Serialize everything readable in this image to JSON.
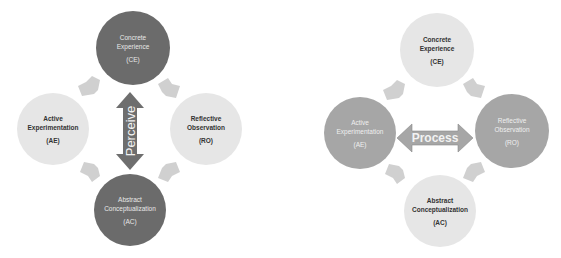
{
  "colors": {
    "dark_circle": "#6b6b6b",
    "light_circle": "#e6e6e6",
    "medium_circle": "#a6a6a6",
    "cycle_arrow": "#d0d0d0",
    "perceive_arrow": "#6e6e6e",
    "process_arrow": "#a6a6a6"
  },
  "diagrams": [
    {
      "name": "perceive-diagram",
      "center_arrow": {
        "label": "Perceive",
        "orientation": "vertical"
      },
      "nodes": {
        "top": {
          "lines": [
            "Concrete",
            "Experience"
          ],
          "abbr": "(CE)",
          "style": "dark"
        },
        "left": {
          "lines": [
            "Active",
            "Experimentation"
          ],
          "abbr": "(AE)",
          "style": "light"
        },
        "right": {
          "lines": [
            "Reflective",
            "Observation"
          ],
          "abbr": "(RO)",
          "style": "light"
        },
        "bottom": {
          "lines": [
            "Abstract",
            "Conceptualization"
          ],
          "abbr": "(AC)",
          "style": "dark"
        }
      }
    },
    {
      "name": "process-diagram",
      "center_arrow": {
        "label": "Process",
        "orientation": "horizontal"
      },
      "nodes": {
        "top": {
          "lines": [
            "Concrete",
            "Experience"
          ],
          "abbr": "(CE)",
          "style": "light"
        },
        "left": {
          "lines": [
            "Active",
            "Experimentation"
          ],
          "abbr": "(AE)",
          "style": "medium"
        },
        "right": {
          "lines": [
            "Reflective",
            "Observation"
          ],
          "abbr": "(RO)",
          "style": "medium"
        },
        "bottom": {
          "lines": [
            "Abstract",
            "Conceptualization"
          ],
          "abbr": "(AC)",
          "style": "light"
        }
      }
    }
  ]
}
